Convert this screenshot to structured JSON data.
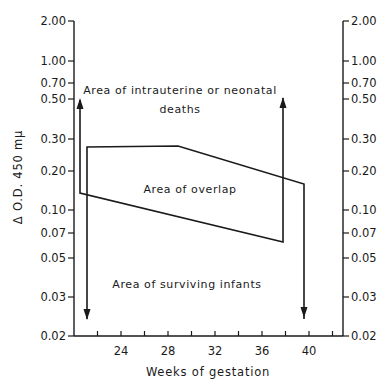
{
  "chart_data": {
    "type": "line",
    "title": "",
    "xlabel": "Weeks of gestation",
    "ylabel": "Δ O.D. 450 mμ",
    "y_scale": "log",
    "ylim": [
      0.02,
      2.0
    ],
    "xlim": [
      20,
      43
    ],
    "grid": false,
    "legend": null,
    "x_ticks": [
      22,
      24,
      26,
      28,
      30,
      32,
      34,
      36,
      38,
      40,
      42
    ],
    "x_tick_labels": [
      "24",
      "28",
      "32",
      "36",
      "40"
    ],
    "y_tick_labels": [
      "2.00",
      "1.00",
      "0.70",
      "0.50",
      "0.30",
      "0.20",
      "0.10",
      "0.07",
      "0.05",
      "0.03",
      "0.02"
    ],
    "y_ticks": [
      2.0,
      1.0,
      0.7,
      0.5,
      0.3,
      0.2,
      0.1,
      0.07,
      0.05,
      0.03,
      0.02
    ],
    "right_axis_mirrors_left": true,
    "series": [
      {
        "name": "Upper boundary (overlap region)",
        "x": [
          21.1,
          21.1,
          28.9,
          39.6,
          39.6
        ],
        "y": [
          0.021,
          0.27,
          0.27,
          0.16,
          0.021
        ],
        "note": "left vertical descends with downward arrow; right vertical descends with downward arrow"
      },
      {
        "name": "Lower boundary (overlap region)",
        "x": [
          20.5,
          20.5,
          37.9,
          37.9
        ],
        "y": [
          0.5,
          0.14,
          0.065,
          0.5
        ],
        "note": "left and right verticals rise with upward arrows"
      }
    ],
    "annotations": [
      {
        "text": "Area of intrauterine or neonatal",
        "x": 30.3,
        "y": 0.62
      },
      {
        "text": "deaths",
        "x": 30.3,
        "y": 0.42
      },
      {
        "text": "Area of overlap",
        "x": 30.3,
        "y": 0.16
      },
      {
        "text": "Area of surviving infants",
        "x": 30.3,
        "y": 0.032
      }
    ]
  },
  "labels": {
    "xlabel": "Weeks of gestation",
    "ylabel": "Δ O.D. 450 mμ",
    "annot_deaths_1": "Area of intrauterine or neonatal",
    "annot_deaths_2": "deaths",
    "annot_overlap": "Area of overlap",
    "annot_surviving": "Area of surviving infants"
  },
  "layout": {
    "plot_left_px": 74,
    "plot_right_px": 343,
    "x_axis_y_px": 336,
    "y_axis_top_px": 21,
    "x_px_per_week": 11.75,
    "x24_px": 121,
    "y_tick_px": [
      21,
      61,
      83,
      99,
      139,
      171,
      210,
      233,
      258,
      297,
      336
    ]
  },
  "shapes": {
    "overlap_upper": [
      [
        87,
        319
      ],
      [
        87,
        147
      ],
      [
        178,
        146
      ],
      [
        304,
        184
      ],
      [
        304,
        319
      ]
    ],
    "overlap_lower": [
      [
        80,
        100
      ],
      [
        80,
        193
      ],
      [
        283,
        242
      ],
      [
        283,
        98
      ]
    ],
    "arrows_down": [
      [
        87,
        319
      ],
      [
        304,
        317
      ]
    ],
    "arrows_up": [
      [
        80,
        99
      ],
      [
        283,
        98
      ]
    ]
  }
}
